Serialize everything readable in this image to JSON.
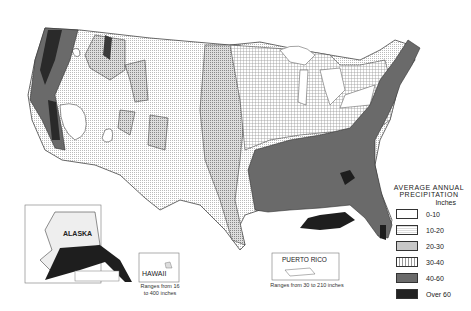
{
  "map": {
    "subject": "United States average annual precipitation"
  },
  "legend": {
    "title_line1": "AVERAGE ANNUAL",
    "title_line2": "PRECIPITATION",
    "unit": "Inches",
    "items": [
      {
        "label": "0-10",
        "color": "#ffffff",
        "pattern": "blank"
      },
      {
        "label": "10-20",
        "color": "#eeeeee",
        "pattern": "fine-dots"
      },
      {
        "label": "20-30",
        "color": "#cfcfcf",
        "pattern": "stipple"
      },
      {
        "label": "30-40",
        "color": "#e2e2e2",
        "pattern": "grid"
      },
      {
        "label": "40-60",
        "color": "#6a6a6a",
        "pattern": "solid-gray"
      },
      {
        "label": "Over 60",
        "color": "#2a2a2a",
        "pattern": "solid-dark"
      }
    ]
  },
  "insets": {
    "alaska": {
      "label": "ALASKA"
    },
    "hawaii": {
      "label": "HAWAII",
      "caption_line1": "Ranges from 16",
      "caption_line2": "to 400 inches"
    },
    "puerto_rico": {
      "label": "PUERTO RICO",
      "caption": "Ranges from 30 to 210 inches"
    }
  }
}
